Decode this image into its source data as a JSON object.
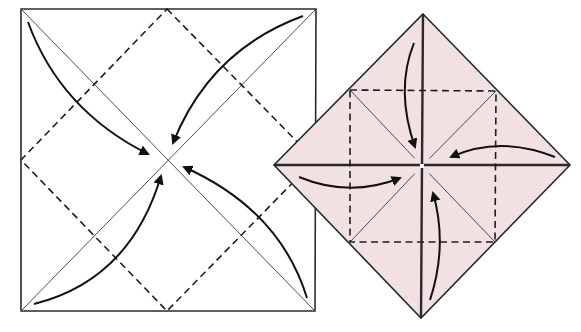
{
  "diagram": {
    "type": "origami-folding-steps",
    "colors": {
      "paper_front": "#ffffff",
      "paper_back": "#f2e1e3",
      "line": "#2a2a2a",
      "arrow": "#111111"
    },
    "steps": [
      {
        "name": "step-1-square",
        "description": "White square with two diagonal creases and a dashed diamond; four curved arrows fold each corner to the center",
        "shape": "square",
        "corners": [
          [
            21,
            9
          ],
          [
            316,
            9
          ],
          [
            315,
            311
          ],
          [
            21,
            311
          ]
        ],
        "center": [
          168,
          160
        ],
        "valley_fold_diamond": [
          [
            167,
            9
          ],
          [
            315,
            160
          ],
          [
            167,
            311
          ],
          [
            21,
            160
          ]
        ],
        "arrows": [
          {
            "from": [
              28,
              22
            ],
            "to": [
              148,
              154
            ],
            "ctrl": [
              60,
              110
            ]
          },
          {
            "from": [
              303,
              16
            ],
            "to": [
              173,
              143
            ],
            "ctrl": [
              210,
              50
            ]
          },
          {
            "from": [
              307,
              298
            ],
            "to": [
              184,
              167
            ],
            "ctrl": [
              280,
              210
            ]
          },
          {
            "from": [
              34,
              304
            ],
            "to": [
              161,
              176
            ],
            "ctrl": [
              130,
              280
            ]
          }
        ]
      },
      {
        "name": "step-2-blintz-base",
        "description": "Pink diamond (corners folded to center) with a dashed inner square; four curved arrows fold the corners to the center again",
        "shape": "diamond",
        "corners": [
          [
            423,
            14
          ],
          [
            570,
            165
          ],
          [
            421,
            318
          ],
          [
            274,
            165
          ]
        ],
        "center": [
          422,
          166
        ],
        "valley_fold_square": [
          [
            350,
            90
          ],
          [
            496,
            91
          ],
          [
            495,
            242
          ],
          [
            350,
            242
          ]
        ],
        "arrows": [
          {
            "from": [
              414,
              43
            ],
            "to": [
              415,
              147
            ],
            "ctrl": [
              395,
              90
            ]
          },
          {
            "from": [
              555,
              157
            ],
            "to": [
              451,
              157
            ],
            "ctrl": [
              500,
              135
            ]
          },
          {
            "from": [
              299,
              177
            ],
            "to": [
              400,
              178
            ],
            "ctrl": [
              350,
              198
            ]
          },
          {
            "from": [
              430,
              300
            ],
            "to": [
              433,
              193
            ],
            "ctrl": [
              448,
              245
            ]
          }
        ]
      }
    ]
  }
}
